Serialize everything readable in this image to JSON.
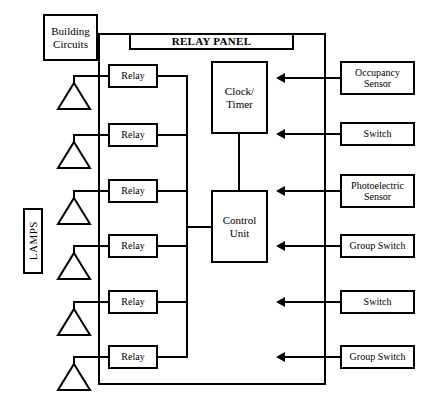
{
  "diagram": {
    "title": "RELAY PANEL",
    "building_circuits_label": "Building Circuits",
    "lamps_label": "LAMPS",
    "clock_timer_label": "Clock/ Timer",
    "control_unit_label": "Control Unit",
    "relays": [
      {
        "label": "Relay"
      },
      {
        "label": "Relay"
      },
      {
        "label": "Relay"
      },
      {
        "label": "Relay"
      },
      {
        "label": "Relay"
      },
      {
        "label": "Relay"
      }
    ],
    "inputs": [
      {
        "label": "Occupancy Sensor"
      },
      {
        "label": "Switch"
      },
      {
        "label": "Photoelectric Sensor"
      },
      {
        "label": "Group Switch"
      },
      {
        "label": "Switch"
      },
      {
        "label": "Group Switch"
      }
    ]
  }
}
